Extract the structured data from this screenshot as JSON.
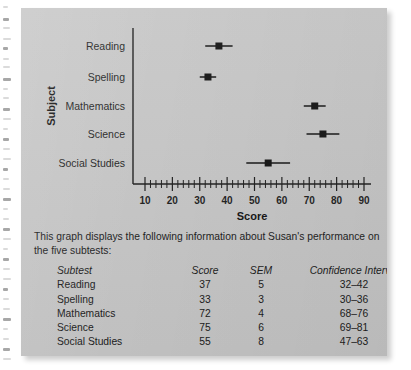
{
  "card": {
    "background_color": "#c6c6c6"
  },
  "chart_data": {
    "type": "scatter",
    "orientation": "horizontal",
    "title": "",
    "xlabel": "Score",
    "ylabel": "Subject",
    "xlim": [
      8,
      92
    ],
    "grid": false,
    "legend": null,
    "categories": [
      "Reading",
      "Spelling",
      "Mathematics",
      "Science",
      "Social Studies"
    ],
    "values": [
      37,
      33,
      72,
      75,
      55
    ],
    "error_low": [
      32,
      30,
      68,
      69,
      47
    ],
    "error_high": [
      42,
      36,
      76,
      81,
      63
    ],
    "sem": [
      5,
      3,
      4,
      6,
      8
    ],
    "x_ticks": [
      10,
      20,
      30,
      40,
      50,
      60,
      70,
      80,
      90
    ],
    "x_tick_labels": [
      "10",
      "20",
      "30",
      "40",
      "50",
      "60",
      "70",
      "80",
      "90"
    ],
    "minor_tick_step": 2,
    "marker": "square",
    "marker_color": "#111111",
    "errorbar_color": "#111111"
  },
  "caption": {
    "text": "This graph displays the following information about Susan's performance on the five subtests:"
  },
  "table": {
    "headers": {
      "subtest": "Subtest",
      "score": "Score",
      "sem": "SEM",
      "confidence_interval": "Confidence Interval"
    },
    "rows": [
      {
        "subtest": "Reading",
        "score": "37",
        "sem": "5",
        "ci": "32–42"
      },
      {
        "subtest": "Spelling",
        "score": "33",
        "sem": "3",
        "ci": "30–36"
      },
      {
        "subtest": "Mathematics",
        "score": "72",
        "sem": "4",
        "ci": "68–76"
      },
      {
        "subtest": "Science",
        "score": "75",
        "sem": "6",
        "ci": "69–81"
      },
      {
        "subtest": "Social Studies",
        "score": "55",
        "sem": "8",
        "ci": "47–63"
      }
    ]
  }
}
